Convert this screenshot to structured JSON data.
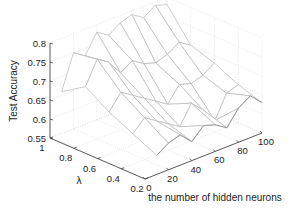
{
  "chart_data": {
    "type": "surface3d",
    "title": "",
    "xlabel": "the number of hidden neurons",
    "ylabel": "λ",
    "zlabel": "Test  Accuracy",
    "x_ticks": [
      "0",
      "20",
      "40",
      "60",
      "80",
      "100"
    ],
    "y_ticks": [
      "0.2",
      "0.4",
      "0.6",
      "0.8",
      "1"
    ],
    "z_ticks": [
      "0.55",
      "0.6",
      "0.65",
      "0.7",
      "0.75",
      "0.8"
    ],
    "xlim": [
      0,
      100
    ],
    "ylim": [
      0.2,
      1
    ],
    "zlim": [
      0.55,
      0.8
    ],
    "grid": true,
    "x": [
      10,
      20,
      30,
      40,
      50,
      60,
      70,
      80,
      90,
      100
    ],
    "y": [
      0.2,
      0.4,
      0.6,
      0.8,
      1.0
    ],
    "z": [
      [
        0.6,
        0.62,
        0.63,
        0.6,
        0.63,
        0.62,
        0.6,
        0.64,
        0.66,
        0.63
      ],
      [
        0.63,
        0.66,
        0.64,
        0.62,
        0.6,
        0.65,
        0.62,
        0.58,
        0.64,
        0.65
      ],
      [
        0.66,
        0.7,
        0.68,
        0.66,
        0.64,
        0.62,
        0.66,
        0.65,
        0.66,
        0.68
      ],
      [
        0.7,
        0.76,
        0.74,
        0.7,
        0.72,
        0.7,
        0.69,
        0.7,
        0.72,
        0.7
      ],
      [
        0.66,
        0.75,
        0.73,
        0.78,
        0.76,
        0.78,
        0.79,
        0.77,
        0.79,
        0.78
      ]
    ]
  },
  "labels": {
    "zlabel": "Test  Accuracy",
    "ylabel": "λ",
    "xlabel": "the number of hidden neurons"
  }
}
